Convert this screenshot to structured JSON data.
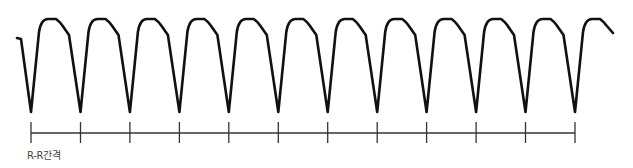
{
  "diagram": {
    "type": "ecg-waveform",
    "stroke_color": "#111111",
    "axis_color": "#333333",
    "beats": 12,
    "first_trough_x": 31,
    "period_px": 49.45,
    "interval_label": "R-R간격"
  }
}
